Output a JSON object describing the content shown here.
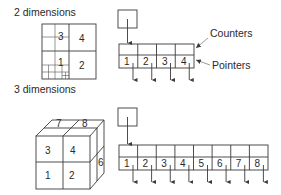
{
  "sections": [
    {
      "title": "2 dimensions",
      "grid_labels": [
        "3",
        "4",
        "1",
        "2"
      ],
      "pointer_cells": [
        "1",
        "2",
        "3",
        "4"
      ],
      "annotations": {
        "counters": "Counters",
        "pointers": "Pointers"
      }
    },
    {
      "title": "3 dimensions",
      "cube_labels": {
        "front": [
          "3",
          "4",
          "1",
          "2"
        ],
        "top": [
          "7",
          "8"
        ],
        "side": [
          "6"
        ]
      },
      "pointer_cells": [
        "1",
        "2",
        "3",
        "4",
        "5",
        "6",
        "7",
        "8"
      ]
    }
  ],
  "colors": {
    "line": "#3a3a3a",
    "text": "#2a2a2a",
    "background": "#ffffff"
  }
}
